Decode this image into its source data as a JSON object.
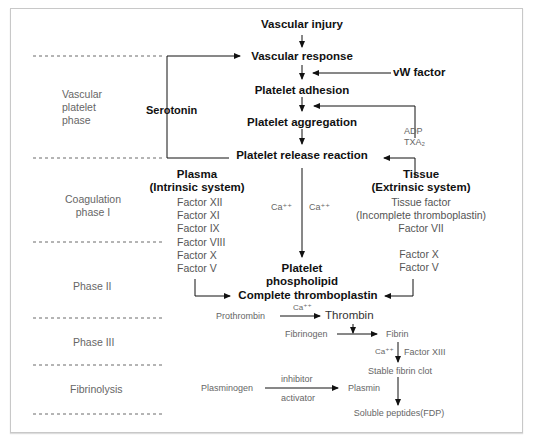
{
  "phases": [
    {
      "label_lines": [
        "Vascular",
        "platelet",
        "phase"
      ]
    },
    {
      "label_lines": [
        "Coagulation",
        "phase I"
      ]
    },
    {
      "label": "Phase II"
    },
    {
      "label": "Phase III"
    },
    {
      "label": "Fibrinolysis"
    }
  ],
  "vascular": {
    "injury": "Vascular injury",
    "response": "Vascular response",
    "vw_factor": "vW factor",
    "adhesion": "Platelet adhesion",
    "aggregation": "Platelet aggregation",
    "adp": "ADP",
    "txa2": "TXA₂",
    "release": "Platelet release reaction",
    "serotonin": "Serotonin"
  },
  "intrinsic": {
    "title": "Plasma",
    "subtitle": "(Intrinsic system)",
    "factors": [
      "Factor XII",
      "Factor XI",
      "Factor IX",
      "Factor VIII",
      "Factor X",
      "Factor V"
    ]
  },
  "extrinsic": {
    "title": "Tissue",
    "subtitle": "(Extrinsic system)",
    "tissue_factor": "Tissue factor",
    "incomplete": "(Incomplete thromboplastin)",
    "factor_vii": "Factor VII",
    "factor_x": "Factor X",
    "factor_v": "Factor V"
  },
  "center": {
    "ca_left": "Ca⁺⁺",
    "ca_right": "Ca⁺⁺",
    "phospholipid_1": "Platelet",
    "phospholipid_2": "phospholipid",
    "complete": "Complete thromboplastin"
  },
  "phase3": {
    "prothrombin": "Prothrombin",
    "ca": "Ca⁺⁺",
    "thrombin": "Thrombin",
    "fibrinogen": "Fibrinogen",
    "fibrin": "Fibrin",
    "ca2": "Ca⁺⁺",
    "factor_xiii": "Factor XIII",
    "stable_clot": "Stable fibrin clot"
  },
  "fibrinolysis": {
    "plasminogen": "Plasminogen",
    "inhibitor": "inhibitor",
    "activator": "activator",
    "plasmin": "Plasmin",
    "fdp": "Soluble peptides(FDP)"
  }
}
